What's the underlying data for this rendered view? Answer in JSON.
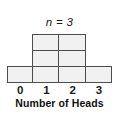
{
  "chart_data": {
    "type": "bar",
    "title": "n = 3",
    "xlabel": "Number of Heads",
    "ylabel": "",
    "categories": [
      "0",
      "1",
      "2",
      "3"
    ],
    "values": [
      1,
      3,
      3,
      1
    ],
    "ylim": [
      0,
      3
    ],
    "grid": false,
    "legend": null,
    "style": {
      "bar_fill": "#f1f1f1",
      "bar_border": "#4d4d4d",
      "text_color": "#1a1a1a",
      "background": "#ffffff"
    }
  }
}
